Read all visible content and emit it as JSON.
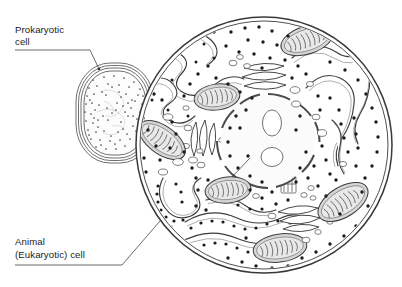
{
  "figure": {
    "type": "biology-diagram",
    "background_color": "#ffffff",
    "line_color": "#3a3a3a",
    "style": "black-and-white line art with stippling and grey shading"
  },
  "labels": {
    "prokaryotic": {
      "line1": "Prokaryotic",
      "line2": "cell",
      "name": "prokaryotic-cell-label"
    },
    "eukaryotic": {
      "line1": "Animal",
      "line2": "(Eukaryotic) cell",
      "name": "animal-eukaryotic-cell-label"
    }
  },
  "prokaryotic_cell": {
    "shape": "rounded oval (bacillus/coccus-like)",
    "center": [
      115,
      113
    ],
    "radius_x": 39,
    "radius_y": 50,
    "wall_layers": 4,
    "interior": "dense stipple (ribosomes) with pale nucleoid region",
    "stipple_count": 150,
    "organelles": []
  },
  "eukaryotic_cell": {
    "shape": "circle",
    "center": [
      264,
      145
    ],
    "radius": 128,
    "membrane_layers": 2,
    "fill_color": "#ffffff",
    "organelles": [
      {
        "kind": "nucleus",
        "label": "nucleus",
        "center": [
          268,
          141
        ],
        "radius": 48,
        "envelope": "segmented (nuclear pores)",
        "nucleoli": 2
      },
      {
        "kind": "mitochondrion",
        "label": "mitochondrion",
        "center": [
          307,
          40
        ],
        "rx": 27,
        "ry": 14,
        "rotation": -18,
        "cristae": 9
      },
      {
        "kind": "mitochondrion",
        "label": "mitochondrion",
        "center": [
          217,
          97
        ],
        "rx": 22,
        "ry": 13,
        "rotation": -8,
        "cristae": 8
      },
      {
        "kind": "mitochondrion",
        "label": "mitochondrion",
        "center": [
          162,
          140
        ],
        "rx": 26,
        "ry": 14,
        "rotation": 35,
        "cristae": 9
      },
      {
        "kind": "mitochondrion",
        "label": "mitochondrion",
        "center": [
          228,
          190
        ],
        "rx": 22,
        "ry": 13,
        "rotation": -6,
        "cristae": 8
      },
      {
        "kind": "mitochondrion",
        "label": "mitochondrion",
        "center": [
          343,
          202
        ],
        "rx": 28,
        "ry": 15,
        "rotation": -32,
        "cristae": 9
      },
      {
        "kind": "mitochondrion",
        "label": "mitochondrion",
        "center": [
          280,
          248
        ],
        "rx": 27,
        "ry": 14,
        "rotation": -8,
        "cristae": 9
      },
      {
        "kind": "rough-er",
        "label": "rough endoplasmic reticulum",
        "region": "upper-left and lower-left",
        "ribosomes": true
      },
      {
        "kind": "smooth-er",
        "label": "smooth endoplasmic reticulum",
        "region": "upper-right and right",
        "ribosomes": false
      },
      {
        "kind": "golgi",
        "label": "Golgi apparatus",
        "center": [
          265,
          78
        ],
        "cisternae": 4
      },
      {
        "kind": "golgi",
        "label": "Golgi apparatus",
        "center": [
          203,
          138
        ],
        "cisternae": 4
      },
      {
        "kind": "golgi",
        "label": "Golgi apparatus",
        "center": [
          296,
          214
        ],
        "cisternae": 4
      },
      {
        "kind": "centriole",
        "label": "centriole",
        "center": [
          288,
          185
        ]
      },
      {
        "kind": "ribosomes",
        "label": "free ribosomes",
        "description": "scattered black dots throughout cytoplasm",
        "count": 190
      },
      {
        "kind": "vesicles",
        "label": "vesicles",
        "description": "small open ovals in cytoplasm",
        "count": 22
      }
    ]
  },
  "leader_lines": [
    {
      "name": "prokaryotic-leader",
      "from": [
        15,
        50
      ],
      "to": [
        98,
        69
      ],
      "target": "prokaryotic cell interior"
    },
    {
      "name": "eukaryotic-leader",
      "from": [
        15,
        265
      ],
      "to": [
        158,
        222
      ],
      "target": "animal cell membrane"
    },
    {
      "name": "nucleus-pointer",
      "from": [
        215,
        195
      ],
      "to": [
        248,
        160
      ],
      "target": "nucleus"
    }
  ]
}
